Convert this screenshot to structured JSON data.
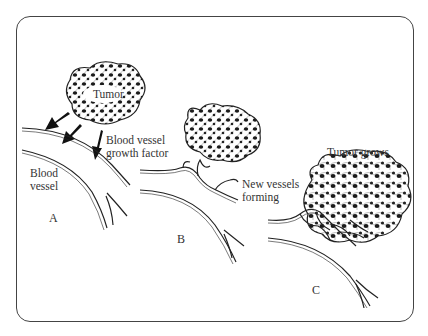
{
  "diagram": {
    "stages": [
      {
        "id": "A",
        "label": "A",
        "annotations": [
          "Tumor",
          "Blood vessel growth factor",
          "Blood vessel"
        ]
      },
      {
        "id": "B",
        "label": "B",
        "annotations": [
          "New vessels forming"
        ]
      },
      {
        "id": "C",
        "label": "C",
        "annotations": [
          "Tumor grows"
        ]
      }
    ]
  },
  "labels": {
    "tumor": "Tumor",
    "growth_factor_line1": "Blood vessel",
    "growth_factor_line2": "growth factor",
    "blood_vessel_line1": "Blood",
    "blood_vessel_line2": "vessel",
    "new_vessels_line1": "New vessels",
    "new_vessels_line2": "forming",
    "tumor_grows": "Tumor grows",
    "panel_a": "A",
    "panel_b": "B",
    "panel_c": "C"
  }
}
